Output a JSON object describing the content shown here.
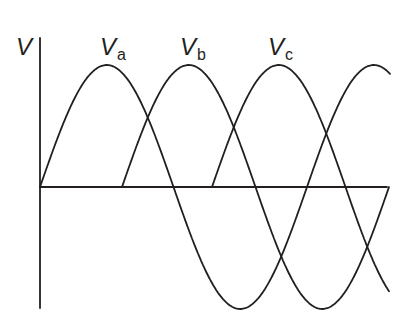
{
  "diagram": {
    "y_axis_label": "V",
    "labels": [
      {
        "main": "V",
        "sub": "a"
      },
      {
        "main": "V",
        "sub": "b"
      },
      {
        "main": "V",
        "sub": "c"
      }
    ],
    "colors": {
      "line": "#231f20",
      "background": "#ffffff"
    }
  },
  "chart_data": {
    "type": "line",
    "title": "",
    "ylabel": "V",
    "xlabel": "",
    "series": [
      {
        "name": "Va",
        "phase_deg": 0,
        "start_x_fraction": 0.0
      },
      {
        "name": "Vb",
        "phase_deg": 120,
        "start_x_fraction": 0.236
      },
      {
        "name": "Vc",
        "phase_deg": 240,
        "start_x_fraction": 0.499
      }
    ],
    "waveform": "sine",
    "amplitude": 1,
    "grid": false
  }
}
